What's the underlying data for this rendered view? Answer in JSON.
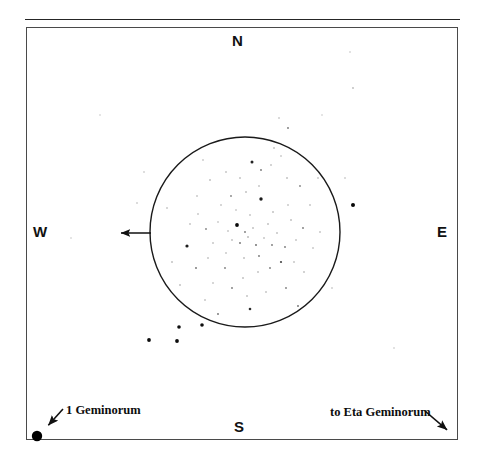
{
  "figure": {
    "type": "star-chart",
    "background_color": "#ffffff",
    "line_color": "#262626"
  },
  "frame": {
    "top_rule": {
      "x": 25,
      "y": 19,
      "width": 435
    },
    "box": {
      "x": 26,
      "y": 27,
      "width": 432,
      "height": 413,
      "border_color": "#4a4a4a"
    }
  },
  "cardinals": [
    {
      "label": "N",
      "position": "top"
    },
    {
      "label": "S",
      "position": "bottom"
    },
    {
      "label": "W",
      "position": "left-outside"
    },
    {
      "label": "E",
      "position": "right-outside"
    }
  ],
  "field_circle": {
    "center_x": 245,
    "center_y": 232,
    "radius": 95,
    "stroke": "#1a1a1a",
    "stroke_width": 1.4
  },
  "pointer_arrow": {
    "name": "west-pointer-arrow",
    "from_x": 151,
    "from_y": 233,
    "to_x": 114,
    "to_y": 233,
    "direction": "west"
  },
  "annotations": [
    {
      "id": "star-1-geminorum",
      "text": "1 Geminorum",
      "text_x": 66,
      "text_y": 404,
      "arrow_from_x": 63,
      "arrow_from_y": 409,
      "arrow_to_x": 44,
      "arrow_to_y": 430,
      "marker": {
        "x": 37,
        "y": 436,
        "r": 5.2,
        "fill": "#000000"
      }
    },
    {
      "id": "direction-eta-geminorum",
      "text": "to Eta Geminorum",
      "text_x": 330,
      "text_y": 406,
      "arrow_from_x": 425,
      "arrow_from_y": 411,
      "arrow_to_x": 452,
      "arrow_to_y": 434,
      "marker": null
    }
  ],
  "chart_data": {
    "type": "scatter",
    "title": "",
    "xlabel": "",
    "ylabel": "",
    "xlim": [
      26,
      458
    ],
    "ylim": [
      27,
      440
    ],
    "grid": false,
    "legend": null,
    "note": "Star positions in pixel coordinates; r = plotted dot radius, g = gray level (0 = black, brighter stars are larger and darker)",
    "stars": [
      {
        "x": 245,
        "y": 232,
        "r": 0.9,
        "g": 120
      },
      {
        "x": 237,
        "y": 225,
        "r": 1.9,
        "g": 10
      },
      {
        "x": 261,
        "y": 199,
        "r": 1.7,
        "g": 25
      },
      {
        "x": 253,
        "y": 228,
        "r": 0.8,
        "g": 150
      },
      {
        "x": 248,
        "y": 237,
        "r": 0.8,
        "g": 140
      },
      {
        "x": 240,
        "y": 243,
        "r": 0.9,
        "g": 110
      },
      {
        "x": 256,
        "y": 245,
        "r": 0.9,
        "g": 100
      },
      {
        "x": 264,
        "y": 238,
        "r": 0.8,
        "g": 160
      },
      {
        "x": 232,
        "y": 240,
        "r": 0.8,
        "g": 155
      },
      {
        "x": 228,
        "y": 231,
        "r": 0.8,
        "g": 165
      },
      {
        "x": 268,
        "y": 224,
        "r": 0.8,
        "g": 150
      },
      {
        "x": 272,
        "y": 245,
        "r": 0.9,
        "g": 120
      },
      {
        "x": 250,
        "y": 215,
        "r": 0.8,
        "g": 160
      },
      {
        "x": 236,
        "y": 210,
        "r": 0.8,
        "g": 170
      },
      {
        "x": 259,
        "y": 256,
        "r": 0.9,
        "g": 115
      },
      {
        "x": 244,
        "y": 258,
        "r": 0.8,
        "g": 150
      },
      {
        "x": 226,
        "y": 253,
        "r": 0.8,
        "g": 165
      },
      {
        "x": 277,
        "y": 233,
        "r": 0.8,
        "g": 155
      },
      {
        "x": 285,
        "y": 247,
        "r": 0.9,
        "g": 120
      },
      {
        "x": 218,
        "y": 222,
        "r": 0.8,
        "g": 170
      },
      {
        "x": 213,
        "y": 243,
        "r": 0.8,
        "g": 160
      },
      {
        "x": 206,
        "y": 229,
        "r": 0.9,
        "g": 130
      },
      {
        "x": 291,
        "y": 220,
        "r": 0.8,
        "g": 150
      },
      {
        "x": 296,
        "y": 240,
        "r": 0.8,
        "g": 160
      },
      {
        "x": 281,
        "y": 262,
        "r": 1.1,
        "g": 70
      },
      {
        "x": 270,
        "y": 268,
        "r": 0.9,
        "g": 120
      },
      {
        "x": 258,
        "y": 272,
        "r": 0.8,
        "g": 155
      },
      {
        "x": 288,
        "y": 205,
        "r": 0.8,
        "g": 165
      },
      {
        "x": 273,
        "y": 212,
        "r": 0.8,
        "g": 150
      },
      {
        "x": 259,
        "y": 186,
        "r": 0.8,
        "g": 160
      },
      {
        "x": 246,
        "y": 192,
        "r": 0.8,
        "g": 150
      },
      {
        "x": 231,
        "y": 196,
        "r": 0.9,
        "g": 130
      },
      {
        "x": 221,
        "y": 205,
        "r": 0.8,
        "g": 165
      },
      {
        "x": 208,
        "y": 258,
        "r": 0.8,
        "g": 160
      },
      {
        "x": 225,
        "y": 268,
        "r": 0.9,
        "g": 125
      },
      {
        "x": 243,
        "y": 278,
        "r": 0.8,
        "g": 150
      },
      {
        "x": 294,
        "y": 262,
        "r": 0.8,
        "g": 160
      },
      {
        "x": 303,
        "y": 228,
        "r": 0.9,
        "g": 120
      },
      {
        "x": 198,
        "y": 214,
        "r": 0.8,
        "g": 165
      },
      {
        "x": 252,
        "y": 162,
        "r": 1.5,
        "g": 35
      },
      {
        "x": 261,
        "y": 170,
        "r": 0.9,
        "g": 115
      },
      {
        "x": 271,
        "y": 165,
        "r": 0.8,
        "g": 160
      },
      {
        "x": 281,
        "y": 156,
        "r": 0.8,
        "g": 170
      },
      {
        "x": 287,
        "y": 178,
        "r": 0.8,
        "g": 150
      },
      {
        "x": 300,
        "y": 186,
        "r": 0.9,
        "g": 130
      },
      {
        "x": 310,
        "y": 205,
        "r": 0.8,
        "g": 160
      },
      {
        "x": 313,
        "y": 248,
        "r": 0.8,
        "g": 165
      },
      {
        "x": 304,
        "y": 272,
        "r": 0.8,
        "g": 155
      },
      {
        "x": 286,
        "y": 288,
        "r": 0.9,
        "g": 125
      },
      {
        "x": 266,
        "y": 292,
        "r": 0.8,
        "g": 160
      },
      {
        "x": 247,
        "y": 296,
        "r": 0.8,
        "g": 155
      },
      {
        "x": 232,
        "y": 288,
        "r": 0.9,
        "g": 120
      },
      {
        "x": 213,
        "y": 283,
        "r": 0.8,
        "g": 165
      },
      {
        "x": 196,
        "y": 268,
        "r": 0.9,
        "g": 110
      },
      {
        "x": 187,
        "y": 246,
        "r": 1.6,
        "g": 30
      },
      {
        "x": 190,
        "y": 224,
        "r": 0.8,
        "g": 160
      },
      {
        "x": 197,
        "y": 196,
        "r": 0.8,
        "g": 165
      },
      {
        "x": 210,
        "y": 180,
        "r": 0.8,
        "g": 150
      },
      {
        "x": 226,
        "y": 172,
        "r": 0.8,
        "g": 160
      },
      {
        "x": 240,
        "y": 178,
        "r": 0.8,
        "g": 155
      },
      {
        "x": 298,
        "y": 306,
        "r": 0.9,
        "g": 110
      },
      {
        "x": 250,
        "y": 309,
        "r": 1.3,
        "g": 45
      },
      {
        "x": 218,
        "y": 314,
        "r": 0.9,
        "g": 110
      },
      {
        "x": 180,
        "y": 285,
        "r": 0.8,
        "g": 150
      },
      {
        "x": 320,
        "y": 232,
        "r": 0.8,
        "g": 160
      },
      {
        "x": 318,
        "y": 178,
        "r": 0.8,
        "g": 165
      },
      {
        "x": 274,
        "y": 148,
        "r": 0.8,
        "g": 160
      },
      {
        "x": 203,
        "y": 160,
        "r": 0.8,
        "g": 170
      },
      {
        "x": 167,
        "y": 208,
        "r": 0.8,
        "g": 165
      },
      {
        "x": 172,
        "y": 262,
        "r": 0.8,
        "g": 150
      },
      {
        "x": 205,
        "y": 300,
        "r": 0.8,
        "g": 160
      },
      {
        "x": 288,
        "y": 128,
        "r": 0.9,
        "g": 115
      },
      {
        "x": 279,
        "y": 118,
        "r": 0.8,
        "g": 170
      },
      {
        "x": 353,
        "y": 205,
        "r": 2.0,
        "g": 8
      },
      {
        "x": 345,
        "y": 178,
        "r": 0.8,
        "g": 175
      },
      {
        "x": 332,
        "y": 288,
        "r": 0.8,
        "g": 175
      },
      {
        "x": 137,
        "y": 203,
        "r": 0.8,
        "g": 175
      },
      {
        "x": 144,
        "y": 172,
        "r": 0.8,
        "g": 180
      },
      {
        "x": 149,
        "y": 340,
        "r": 1.9,
        "g": 12
      },
      {
        "x": 177,
        "y": 341,
        "r": 1.9,
        "g": 12
      },
      {
        "x": 179,
        "y": 327,
        "r": 1.8,
        "g": 15
      },
      {
        "x": 202,
        "y": 325,
        "r": 1.8,
        "g": 15
      },
      {
        "x": 350,
        "y": 52,
        "r": 0.8,
        "g": 190
      },
      {
        "x": 353,
        "y": 88,
        "r": 0.9,
        "g": 185
      },
      {
        "x": 394,
        "y": 348,
        "r": 0.8,
        "g": 190
      },
      {
        "x": 100,
        "y": 115,
        "r": 0.8,
        "g": 195
      },
      {
        "x": 71,
        "y": 238,
        "r": 0.8,
        "g": 195
      },
      {
        "x": 322,
        "y": 115,
        "r": 0.8,
        "g": 195
      }
    ]
  }
}
